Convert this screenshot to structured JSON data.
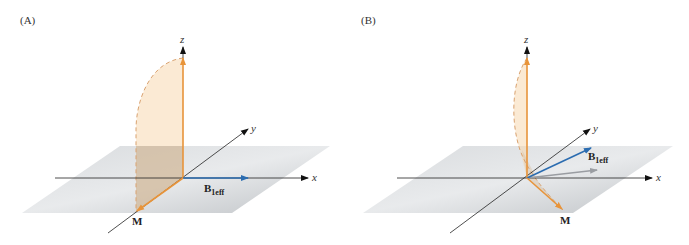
{
  "figure": {
    "panels": [
      {
        "id": "A",
        "label": "(A)",
        "axes": {
          "x": "x",
          "y": "y",
          "z": "z"
        },
        "vectors": {
          "magnetization": "M",
          "effective_field": {
            "main": "B",
            "sub": "1eff"
          }
        },
        "description": "B1eff along x-axis; M rotates from z into the plane toward -y"
      },
      {
        "id": "B",
        "label": "(B)",
        "axes": {
          "x": "x",
          "y": "y",
          "z": "z"
        },
        "vectors": {
          "magnetization": "M",
          "effective_field": {
            "main": "B",
            "sub": "1eff"
          }
        },
        "description": "B1eff tilted out of plane; M precesses along a narrower cone"
      }
    ],
    "colors": {
      "magnetization": "#e8943a",
      "effective_field": "#2b6cb0",
      "plane": "#c8ccd0",
      "sweep_fill": "#f7d9b0",
      "axis": "#222222",
      "projection": "#9a9da2"
    }
  }
}
